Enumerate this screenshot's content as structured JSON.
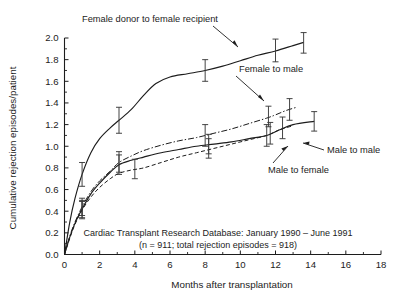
{
  "chart_data": {
    "type": "line",
    "title": "",
    "xlabel": "Months after transplantation",
    "ylabel": "Cumulative rejection episodes/patient",
    "xlim": [
      0,
      18
    ],
    "ylim": [
      0,
      2.0
    ],
    "xticks": [
      0,
      2,
      4,
      6,
      8,
      10,
      12,
      14,
      16,
      18
    ],
    "xticklabels": [
      "0",
      "2",
      "4",
      "6",
      "8",
      "10",
      "12",
      "14",
      "16",
      "18"
    ],
    "yticks": [
      0.0,
      0.2,
      0.4,
      0.6,
      0.8,
      1.0,
      1.2,
      1.4,
      1.6,
      1.8,
      2.0
    ],
    "yticklabels": [
      "0.0",
      "0.2",
      "0.4",
      "0.6",
      "0.8",
      "1.0",
      "1.2",
      "1.4",
      "1.6",
      "1.8",
      "2.0"
    ],
    "grid": false,
    "legend_position": "inline-annotations",
    "series": [
      {
        "name": "Female donor to female recipient",
        "style": "solid",
        "x": [
          0.0,
          0.3,
          0.6,
          1.0,
          1.5,
          2.0,
          2.6,
          3.1,
          3.8,
          4.5,
          5.2,
          6.0,
          7.0,
          8.0,
          9.0,
          10.0,
          11.0,
          12.0,
          13.0,
          13.6
        ],
        "values": [
          0.0,
          0.3,
          0.52,
          0.74,
          0.94,
          1.07,
          1.17,
          1.24,
          1.34,
          1.47,
          1.58,
          1.64,
          1.67,
          1.7,
          1.74,
          1.79,
          1.84,
          1.88,
          1.93,
          1.96
        ],
        "errorbars": [
          {
            "x": 1.0,
            "y": 0.74,
            "lo": 0.63,
            "hi": 0.85
          },
          {
            "x": 3.1,
            "y": 1.24,
            "lo": 1.12,
            "hi": 1.36
          },
          {
            "x": 8.0,
            "y": 1.7,
            "lo": 1.6,
            "hi": 1.8
          },
          {
            "x": 12.0,
            "y": 1.88,
            "lo": 1.78,
            "hi": 1.99
          },
          {
            "x": 13.6,
            "y": 1.96,
            "lo": 1.86,
            "hi": 2.05
          }
        ]
      },
      {
        "name": "Female to male",
        "style": "dash-dot",
        "x": [
          0.0,
          0.3,
          0.6,
          1.0,
          1.5,
          2.0,
          2.6,
          3.1,
          3.8,
          4.5,
          5.5,
          6.5,
          7.5,
          8.5,
          9.5,
          10.5,
          11.5,
          12.0,
          12.6,
          13.2
        ],
        "values": [
          0.0,
          0.17,
          0.3,
          0.44,
          0.58,
          0.68,
          0.77,
          0.85,
          0.91,
          0.96,
          1.01,
          1.05,
          1.08,
          1.12,
          1.16,
          1.21,
          1.26,
          1.29,
          1.33,
          1.36
        ],
        "errorbars": [
          {
            "x": 1.0,
            "y": 0.44,
            "lo": 0.36,
            "hi": 0.52
          },
          {
            "x": 3.1,
            "y": 0.85,
            "lo": 0.76,
            "hi": 0.95
          },
          {
            "x": 8.0,
            "y": 1.1,
            "lo": 1.0,
            "hi": 1.2
          },
          {
            "x": 11.6,
            "y": 1.27,
            "lo": 1.18,
            "hi": 1.37
          },
          {
            "x": 12.8,
            "y": 1.34,
            "lo": 1.24,
            "hi": 1.44
          }
        ]
      },
      {
        "name": "Male to male",
        "style": "solid",
        "x": [
          0.0,
          0.3,
          0.6,
          1.0,
          1.5,
          2.0,
          2.6,
          3.1,
          3.8,
          4.5,
          5.5,
          6.5,
          7.5,
          8.5,
          9.5,
          10.5,
          11.5,
          12.2,
          13.0,
          14.2
        ],
        "values": [
          0.0,
          0.16,
          0.29,
          0.42,
          0.56,
          0.66,
          0.76,
          0.83,
          0.87,
          0.9,
          0.94,
          0.97,
          1.0,
          1.02,
          1.04,
          1.07,
          1.1,
          1.15,
          1.2,
          1.23
        ],
        "errorbars": [
          {
            "x": 1.0,
            "y": 0.42,
            "lo": 0.34,
            "hi": 0.5
          },
          {
            "x": 3.1,
            "y": 0.83,
            "lo": 0.74,
            "hi": 0.92
          },
          {
            "x": 8.2,
            "y": 1.02,
            "lo": 0.93,
            "hi": 1.11
          },
          {
            "x": 11.5,
            "y": 1.1,
            "lo": 1.0,
            "hi": 1.2
          },
          {
            "x": 12.4,
            "y": 1.17,
            "lo": 1.07,
            "hi": 1.27
          },
          {
            "x": 14.2,
            "y": 1.23,
            "lo": 1.14,
            "hi": 1.32
          }
        ]
      },
      {
        "name": "Male to female",
        "style": "dashed",
        "x": [
          0.0,
          0.3,
          0.6,
          1.0,
          1.5,
          2.0,
          2.6,
          3.1,
          3.8,
          4.5,
          5.5,
          6.5,
          7.5,
          8.5,
          9.5,
          10.5,
          11.5,
          12.2,
          13.0
        ],
        "values": [
          0.0,
          0.15,
          0.28,
          0.41,
          0.53,
          0.62,
          0.7,
          0.75,
          0.78,
          0.8,
          0.85,
          0.9,
          0.94,
          0.98,
          1.02,
          1.06,
          1.1,
          1.15,
          1.19
        ],
        "errorbars": [
          {
            "x": 1.0,
            "y": 0.41,
            "lo": 0.33,
            "hi": 0.49
          },
          {
            "x": 4.0,
            "y": 0.79,
            "lo": 0.7,
            "hi": 0.88
          },
          {
            "x": 8.2,
            "y": 0.98,
            "lo": 0.89,
            "hi": 1.07
          },
          {
            "x": 11.7,
            "y": 1.12,
            "lo": 1.02,
            "hi": 1.22
          }
        ]
      }
    ],
    "annotations": [
      {
        "name": "female-to-female-label",
        "text": "Female donor to female recipient",
        "x": 3.0,
        "y": 2.22
      },
      {
        "name": "female-to-male-label",
        "text": "Female to male",
        "x": 8.7,
        "y": 1.72
      },
      {
        "name": "male-to-male-label",
        "text": "Male to male",
        "x": 14.4,
        "y": 1.1
      },
      {
        "name": "male-to-female-label",
        "text": "Male to female",
        "x": 11.4,
        "y": 0.92
      }
    ],
    "caption_lines": [
      "Cardiac Transplant Research Database: January 1990 – June 1991",
      "(n = 911; total rejection episodes = 918)"
    ]
  }
}
